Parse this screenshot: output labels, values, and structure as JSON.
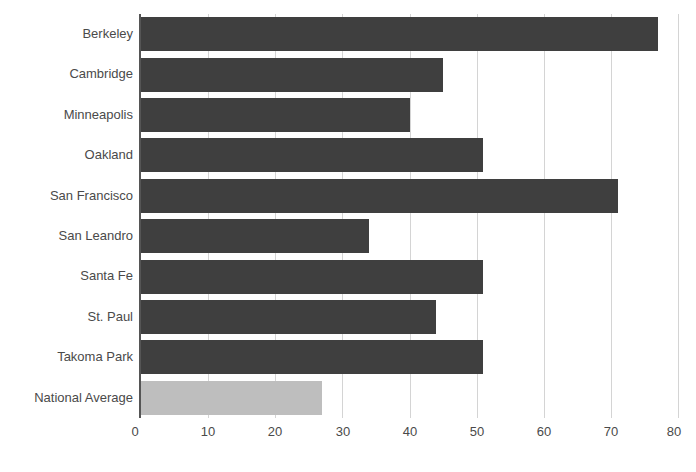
{
  "chart_data": {
    "type": "bar",
    "orientation": "horizontal",
    "title": "",
    "subtitle": "",
    "xlabel": "",
    "ylabel": "",
    "xlim": [
      0,
      80
    ],
    "grid": true,
    "legend": false,
    "legend_position": "none",
    "xticks": [
      0,
      10,
      20,
      30,
      40,
      50,
      60,
      70,
      80
    ],
    "xtick_labels": [
      "0",
      "10",
      "20",
      "30",
      "40",
      "50",
      "60",
      "70",
      "80"
    ],
    "categories": [
      "Berkeley",
      "Cambridge",
      "Minneapolis",
      "Oakland",
      "San Francisco",
      "San Leandro",
      "Santa Fe",
      "St. Paul",
      "Takoma Park",
      "National Average"
    ],
    "values": [
      77,
      45,
      40,
      51,
      71,
      34,
      51,
      44,
      51,
      27
    ],
    "bar_colors": [
      "#3f3f3f",
      "#3f3f3f",
      "#3f3f3f",
      "#3f3f3f",
      "#3f3f3f",
      "#3f3f3f",
      "#3f3f3f",
      "#3f3f3f",
      "#3f3f3f",
      "#bebebe"
    ],
    "series": [
      {
        "name": "",
        "values": [
          77,
          45,
          40,
          51,
          71,
          34,
          51,
          44,
          51,
          27
        ]
      }
    ]
  },
  "colors": {
    "bar_primary": "#3f3f3f",
    "bar_highlight": "#bebebe",
    "gridline": "#d4d4d4",
    "axis": "#555555",
    "text": "#4a4a4a",
    "background": "#ffffff"
  }
}
